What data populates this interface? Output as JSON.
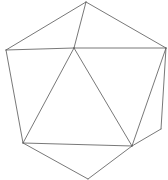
{
  "diagram": {
    "type": "polyhedron-line-drawing",
    "stroke_color": "#555555",
    "background": "#ffffff",
    "vertices": {
      "A": [
        86,
        2
      ],
      "B": [
        6,
        50
      ],
      "C": [
        74,
        48
      ],
      "D": [
        166,
        48
      ],
      "E": [
        23,
        143
      ],
      "F": [
        132,
        146
      ],
      "G": [
        161,
        129
      ],
      "H": [
        88,
        179
      ]
    },
    "edges": [
      [
        "A",
        "B"
      ],
      [
        "A",
        "D"
      ],
      [
        "A",
        "C"
      ],
      [
        "B",
        "C"
      ],
      [
        "C",
        "D"
      ],
      [
        "B",
        "E"
      ],
      [
        "C",
        "E"
      ],
      [
        "C",
        "F"
      ],
      [
        "E",
        "F"
      ],
      [
        "D",
        "F"
      ],
      [
        "D",
        "G"
      ],
      [
        "G",
        "F"
      ],
      [
        "E",
        "H"
      ],
      [
        "F",
        "H"
      ]
    ]
  }
}
